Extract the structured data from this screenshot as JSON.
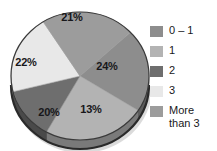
{
  "chart_data": {
    "type": "pie",
    "title": "",
    "subtitle": "",
    "xlabel": "",
    "ylabel": "",
    "grid": false,
    "legend_position": "right",
    "three_d": true,
    "start_angle_deg": -43,
    "direction": "clockwise",
    "categories": [
      "0 – 1",
      "1",
      "2",
      "3",
      "More than 3"
    ],
    "values": [
      21,
      24,
      13,
      20,
      22
    ],
    "value_unit": "%",
    "data_labels": [
      "21%",
      "24%",
      "13%",
      "20%",
      "22%"
    ],
    "colors": [
      "#8d8d8d",
      "#b3b3b3",
      "#6e6e6e",
      "#e8e8e8",
      "#9c9c9c"
    ],
    "slices": [
      {
        "category": "0 – 1",
        "value": 21,
        "label": "21%",
        "color": "#8d8d8d",
        "side_color": "#5c5c5c",
        "label_x": 72,
        "label_y": 18
      },
      {
        "category": "1",
        "value": 24,
        "label": "24%",
        "color": "#b3b3b3",
        "side_color": "#7a7a7a",
        "label_x": 107,
        "label_y": 67
      },
      {
        "category": "2",
        "value": 13,
        "label": "13%",
        "color": "#6e6e6e",
        "side_color": "#4a4a4a",
        "label_x": 91,
        "label_y": 110
      },
      {
        "category": "3",
        "value": 20,
        "label": "20%",
        "color": "#e8e8e8",
        "side_color": "#9e9e9e",
        "label_x": 49,
        "label_y": 113
      },
      {
        "category": "More than 3",
        "value": 22,
        "label": "22%",
        "color": "#9c9c9c",
        "side_color": "#6a6a6a",
        "label_x": 26,
        "label_y": 63
      }
    ]
  },
  "legend": {
    "items": [
      {
        "label": "0 – 1",
        "color": "#8d8d8d"
      },
      {
        "label": "1",
        "color": "#b3b3b3"
      },
      {
        "label": "2",
        "color": "#6e6e6e"
      },
      {
        "label": "3",
        "color": "#e8e8e8"
      },
      {
        "label": "More\nthan 3",
        "color": "#9c9c9c"
      }
    ]
  },
  "style": {
    "background": "#ffffff",
    "label_text_color": "#17171a",
    "legend_text_color": "#18181b",
    "pie_outline": "#3a3a3a",
    "pie_depth_shadow": "#2a2a2a"
  }
}
